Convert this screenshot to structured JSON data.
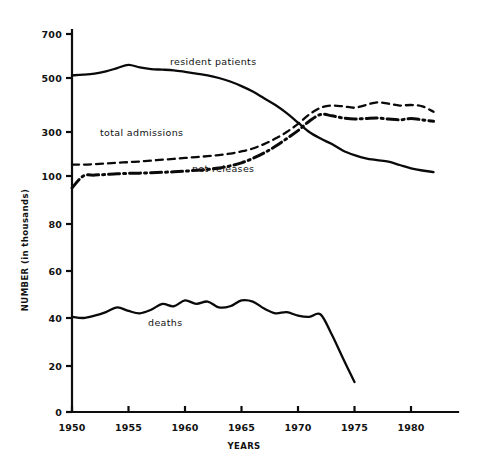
{
  "chart_data": {
    "type": "line",
    "title": "",
    "xlabel": "YEARS",
    "ylabel": "NUMBER  (in thousands)",
    "grid": false,
    "legend_position": "inline-labels",
    "x_ticks": [
      1950,
      1955,
      1960,
      1965,
      1970,
      1975,
      1980
    ],
    "x_tick_labels": [
      "1950",
      "1955",
      "1960",
      "1965",
      "1970",
      "1975",
      "1980"
    ],
    "xlim": [
      1950,
      1982
    ],
    "y_ticks": [
      0,
      20,
      40,
      60,
      80,
      100,
      300,
      500,
      700
    ],
    "y_tick_labels": [
      "0",
      "20",
      "40",
      "60",
      "80",
      "100",
      "300",
      "500",
      "700"
    ],
    "y_scale_note": "broken / compressed scale above 100",
    "series": [
      {
        "name": "resident patients",
        "style": "solid",
        "label_text": "resident patients",
        "x": [
          1950,
          1951,
          1952,
          1953,
          1954,
          1955,
          1956,
          1957,
          1958,
          1959,
          1960,
          1961,
          1962,
          1963,
          1964,
          1965,
          1966,
          1967,
          1968,
          1969,
          1970,
          1971,
          1972,
          1973,
          1974,
          1975,
          1976,
          1977,
          1978,
          1979,
          1980,
          1981,
          1982
        ],
        "values": [
          512,
          515,
          520,
          530,
          545,
          560,
          548,
          540,
          538,
          535,
          528,
          520,
          512,
          500,
          487,
          470,
          450,
          425,
          400,
          370,
          335,
          300,
          270,
          245,
          215,
          195,
          180,
          172,
          165,
          150,
          135,
          125,
          118
        ]
      },
      {
        "name": "total admissions",
        "style": "dashed",
        "label_text": "total admissions",
        "x": [
          1950,
          1951,
          1952,
          1953,
          1954,
          1955,
          1956,
          1957,
          1958,
          1959,
          1960,
          1961,
          1962,
          1963,
          1964,
          1965,
          1966,
          1967,
          1968,
          1969,
          1970,
          1971,
          1972,
          1973,
          1974,
          1975,
          1976,
          1977,
          1978,
          1979,
          1980,
          1981,
          1982
        ],
        "values": [
          152,
          152,
          154,
          157,
          160,
          163,
          166,
          170,
          174,
          178,
          182,
          186,
          190,
          195,
          202,
          212,
          225,
          245,
          270,
          300,
          330,
          365,
          390,
          398,
          395,
          390,
          400,
          410,
          405,
          398,
          400,
          395,
          375
        ]
      },
      {
        "name": "net releases",
        "style": "dash-dot",
        "label_text": "net releases",
        "x": [
          1950,
          1951,
          1952,
          1953,
          1954,
          1955,
          1956,
          1957,
          1958,
          1959,
          1960,
          1961,
          1962,
          1963,
          1964,
          1965,
          1966,
          1967,
          1968,
          1969,
          1970,
          1971,
          1972,
          1973,
          1974,
          1975,
          1976,
          1977,
          1978,
          1979,
          1980,
          1981,
          1982
        ],
        "values": [
          95,
          100,
          104,
          107,
          110,
          112,
          113,
          115,
          117,
          119,
          122,
          126,
          130,
          136,
          146,
          160,
          180,
          205,
          235,
          270,
          305,
          340,
          365,
          360,
          352,
          348,
          350,
          352,
          348,
          345,
          350,
          345,
          340
        ]
      },
      {
        "name": "deaths",
        "style": "solid",
        "label_text": "deaths",
        "x": [
          1950,
          1951,
          1952,
          1953,
          1954,
          1955,
          1956,
          1957,
          1958,
          1959,
          1960,
          1961,
          1962,
          1963,
          1964,
          1965,
          1966,
          1967,
          1968,
          1969,
          1970,
          1971,
          1972,
          1973,
          1974,
          1975
        ],
        "values": [
          40.5,
          40.0,
          41.0,
          42.5,
          44.5,
          43.0,
          42.0,
          43.5,
          46.0,
          45.0,
          47.5,
          46.0,
          47.0,
          44.5,
          45.0,
          47.5,
          47.0,
          44.0,
          42.0,
          42.5,
          41.0,
          40.5,
          41.5,
          33.0,
          23.0,
          13.0
        ]
      }
    ]
  },
  "annotations": {
    "resident_patients_label": "resident patients",
    "total_admissions_label": "total admissions",
    "net_releases_label": "net releases",
    "deaths_label": "deaths"
  }
}
